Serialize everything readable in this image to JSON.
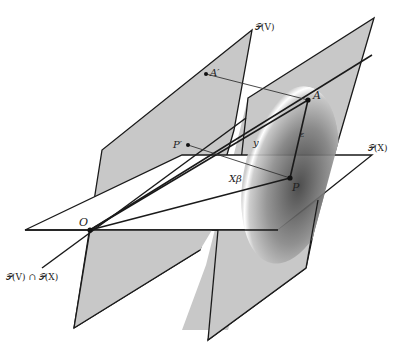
{
  "diagram": {
    "planes": {
      "PV": {
        "label": "𝒫(V)",
        "fill": "#c8c8c8"
      },
      "PX": {
        "label": "𝒫(X)",
        "fill": "#ffffff"
      },
      "right": {
        "fill": "#c8c8c8"
      },
      "intersection": {
        "label": "𝒫(V) ∩ 𝒫(X)"
      }
    },
    "points": {
      "O": "O",
      "A": "A",
      "A_prime": "A′",
      "P": "P",
      "P_prime": "P′"
    },
    "segment_labels": {
      "y": "y",
      "X_beta": "Xβ",
      "epsilon": "ε"
    },
    "colors": {
      "stroke": "#1a1a1a",
      "plane_gray": "#c8c8c8",
      "ellipse_dark": "#3a3a3a"
    }
  }
}
